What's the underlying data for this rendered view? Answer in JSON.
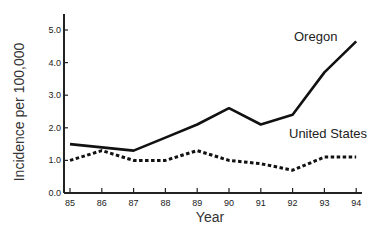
{
  "chart_data": {
    "type": "line",
    "title": "",
    "xlabel": "Year",
    "ylabel": "Incidence per 100,000",
    "x": [
      "85",
      "86",
      "87",
      "88",
      "89",
      "90",
      "91",
      "92",
      "93",
      "94"
    ],
    "series": [
      {
        "name": "Oregon",
        "style": "solid",
        "values": [
          1.5,
          1.4,
          1.3,
          1.7,
          2.1,
          2.6,
          2.1,
          2.4,
          3.7,
          4.65
        ]
      },
      {
        "name": "United States",
        "style": "dotted",
        "values": [
          1.0,
          1.3,
          1.0,
          1.0,
          1.3,
          1.0,
          0.9,
          0.7,
          1.1,
          1.1
        ]
      }
    ],
    "yticks": [
      "0.0",
      "1.0",
      "2.0",
      "3.0",
      "4.0",
      "5.0"
    ],
    "ylim": [
      0,
      5.4
    ],
    "grid": false,
    "legend": "inline labels"
  },
  "colors": {
    "line": "#111111",
    "axis": "#222222",
    "text": "#222222"
  }
}
